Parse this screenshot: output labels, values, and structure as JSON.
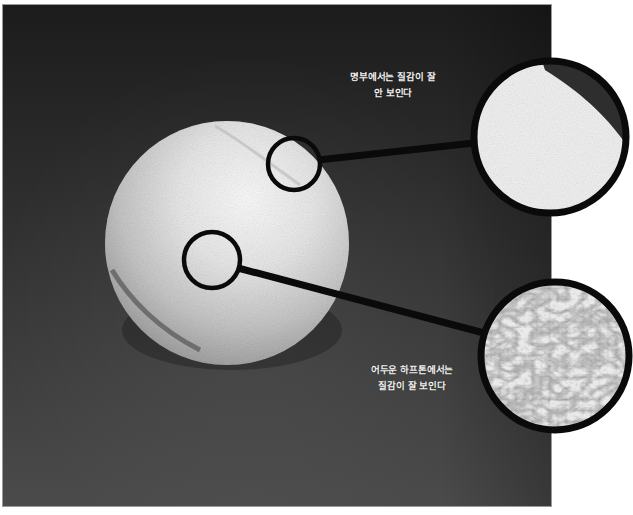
{
  "figure": {
    "colors": {
      "background_top": "#1c1c1c",
      "background_bottom": "#4b4b4b",
      "ball_light": "#f4f4f4",
      "ball_shadow": "#8a8a8a",
      "callout_stroke": "#0a0a0a",
      "caption_text": "#f2f2f2",
      "page": "#ffffff"
    },
    "callouts": [
      {
        "id": "highlight",
        "caption_lines": [
          "명부에서는 질감이 잘",
          "안 보인다"
        ],
        "source_circle": {
          "cx": 294,
          "cy": 164,
          "r": 26
        },
        "magnified_circle": {
          "cx": 550,
          "cy": 137,
          "r": 78
        },
        "texture": "smooth-bright"
      },
      {
        "id": "halftone",
        "caption_lines": [
          "어두운 하프톤에서는",
          "질감이 잘 보인다"
        ],
        "source_circle": {
          "cx": 212,
          "cy": 260,
          "r": 28
        },
        "magnified_circle": {
          "cx": 555,
          "cy": 356,
          "r": 76
        },
        "texture": "fibrous-detailed"
      }
    ]
  }
}
